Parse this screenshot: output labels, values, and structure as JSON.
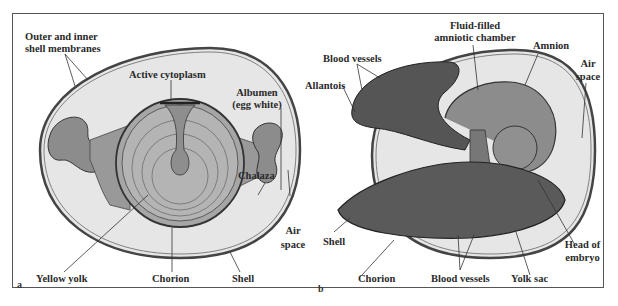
{
  "figure": {
    "panels": [
      {
        "id": "a",
        "letter": "a",
        "labels": {
          "outer_inner_membranes_1": "Outer and inner",
          "outer_inner_membranes_2": "shell membranes",
          "active_cytoplasm": "Active cytoplasm",
          "albumen_1": "Albumen",
          "albumen_2": "(egg white)",
          "chalaza": "Chalaza",
          "air_space_1": "Air",
          "air_space_2": "space",
          "yellow_yolk": "Yellow yolk",
          "chorion": "Chorion",
          "shell": "Shell"
        }
      },
      {
        "id": "b",
        "letter": "b",
        "labels": {
          "fluid_filled_1": "Fluid-filled",
          "fluid_filled_2": "amniotic chamber",
          "amnion": "Amnion",
          "blood_vessels_top": "Blood vessels",
          "allantois": "Allantois",
          "air_space_1": "Air",
          "air_space_2": "space",
          "shell": "Shell",
          "head_of_embryo_1": "Head of",
          "head_of_embryo_2": "embryo",
          "chorion": "Chorion",
          "blood_vessels_bottom": "Blood vessels",
          "yolk_sac": "Yolk sac"
        }
      }
    ],
    "colors": {
      "shell_fill": "#e6e6e6",
      "structure_fill": "#9a9a9a",
      "dark_fill": "#7a7a7a",
      "line": "#2a2a2a",
      "frame": "#555555"
    }
  }
}
